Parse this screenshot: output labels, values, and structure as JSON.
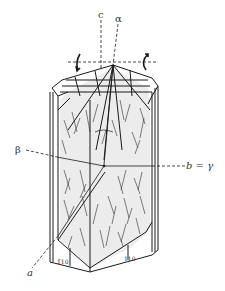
{
  "figure": {
    "type": "crystal optical orientation diagram",
    "colors": {
      "ink": "#1a1a1a",
      "face_fill": "#ececec",
      "background": "#ffffff"
    }
  },
  "axes": {
    "c": {
      "label": "c"
    },
    "alpha": {
      "label": "α"
    },
    "beta": {
      "label": "β"
    },
    "b_gamma": {
      "label": "b = γ"
    },
    "a": {
      "label": "a"
    }
  },
  "faces": {
    "left": {
      "label": "1̄10"
    },
    "right": {
      "label": "110"
    }
  },
  "annotations": {
    "rotation_arrows": [
      "left-curved-arrow",
      "right-curved-arrow"
    ],
    "extinction_angle_arc": "arc between c and α"
  }
}
